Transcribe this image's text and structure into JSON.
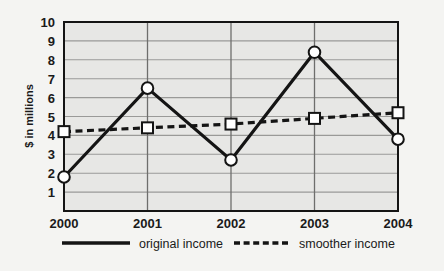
{
  "chart_data": {
    "type": "line",
    "title": "",
    "xlabel": "",
    "ylabel": "$ in millions",
    "categories": [
      "2000",
      "2001",
      "2002",
      "2003",
      "2004"
    ],
    "x": [
      2000,
      2001,
      2002,
      2003,
      2004
    ],
    "ylim": [
      0,
      10
    ],
    "yticks": [
      1,
      2,
      3,
      4,
      5,
      6,
      7,
      8,
      9,
      10
    ],
    "ytick_labels": [
      "1",
      "2",
      "3",
      "4",
      "5",
      "6",
      "7",
      "8",
      "9",
      "10"
    ],
    "grid": "horizontal-and-vertical",
    "legend_position": "bottom",
    "series": [
      {
        "name": "original income",
        "values": [
          1.8,
          6.5,
          2.7,
          8.4,
          3.8
        ],
        "style": "solid",
        "marker": "circle",
        "color": "#141414"
      },
      {
        "name": "smoother income",
        "values": [
          4.2,
          4.4,
          4.6,
          4.9,
          5.2
        ],
        "style": "dashed",
        "marker": "square",
        "color": "#141414"
      }
    ]
  },
  "legend": {
    "entries": [
      {
        "label": "original income",
        "swatch": "solid-line-swatch"
      },
      {
        "label": "smoother income",
        "swatch": "dashed-line-swatch"
      }
    ]
  },
  "colors": {
    "page_background": "#f4f4f2",
    "plot_background": "#e7e7e5",
    "gridline": "#9a9a98",
    "axis": "#141414",
    "series_line": "#141414",
    "marker_fill": "#ffffff",
    "text": "#1a1a1a"
  }
}
